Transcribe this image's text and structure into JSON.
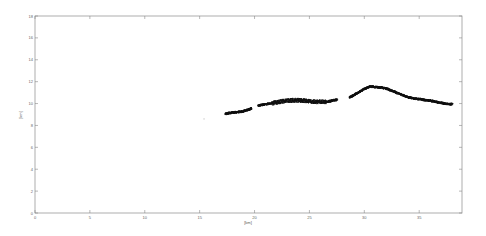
{
  "chart_data": {
    "type": "scatter",
    "title": "",
    "xlabel": "[km]",
    "ylabel": "[km]",
    "xlim": [
      0,
      38.9
    ],
    "ylim": [
      0,
      18
    ],
    "grid": false,
    "legend": null,
    "x_ticks": [
      0,
      5,
      10,
      15,
      20,
      25,
      30,
      35
    ],
    "y_ticks": [
      0,
      2,
      4,
      6,
      8,
      10,
      12,
      14,
      16,
      18
    ],
    "series": [
      {
        "name": "segment-1",
        "color": "#111111",
        "points": [
          [
            17.3,
            9.1
          ],
          [
            17.8,
            9.2
          ],
          [
            18.3,
            9.25
          ],
          [
            18.8,
            9.3
          ],
          [
            19.3,
            9.45
          ],
          [
            19.7,
            9.6
          ]
        ]
      },
      {
        "name": "segment-2",
        "color": "#111111",
        "points": [
          [
            20.3,
            9.85
          ],
          [
            20.8,
            9.95
          ],
          [
            21.5,
            10.05
          ],
          [
            22.0,
            10.15
          ],
          [
            22.5,
            10.25
          ],
          [
            23.0,
            10.3
          ],
          [
            23.5,
            10.35
          ],
          [
            24.0,
            10.35
          ],
          [
            24.5,
            10.3
          ],
          [
            25.0,
            10.25
          ],
          [
            25.5,
            10.2
          ],
          [
            26.0,
            10.2
          ],
          [
            26.5,
            10.2
          ],
          [
            27.0,
            10.3
          ],
          [
            27.5,
            10.4
          ]
        ]
      },
      {
        "name": "segment-3",
        "color": "#111111",
        "points": [
          [
            28.6,
            10.6
          ],
          [
            29.0,
            10.8
          ],
          [
            29.5,
            11.1
          ],
          [
            30.0,
            11.4
          ],
          [
            30.5,
            11.6
          ],
          [
            31.0,
            11.55
          ],
          [
            31.5,
            11.5
          ],
          [
            32.0,
            11.4
          ],
          [
            32.5,
            11.2
          ],
          [
            33.0,
            11.0
          ],
          [
            33.5,
            10.8
          ],
          [
            34.0,
            10.6
          ],
          [
            34.5,
            10.5
          ],
          [
            35.0,
            10.45
          ],
          [
            35.5,
            10.35
          ],
          [
            36.0,
            10.3
          ],
          [
            36.5,
            10.2
          ],
          [
            37.0,
            10.1
          ],
          [
            37.5,
            10.0
          ],
          [
            38.0,
            10.0
          ]
        ]
      },
      {
        "name": "isolated-point",
        "color": "#bbbbbb",
        "points": [
          [
            15.4,
            8.6
          ]
        ]
      }
    ]
  }
}
